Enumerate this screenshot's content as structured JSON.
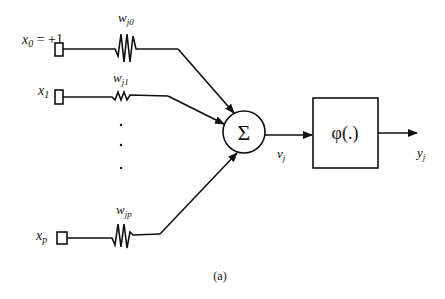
{
  "diagram": {
    "type": "neuron-model",
    "caption": "(a)",
    "inputs": [
      {
        "id": "x0",
        "label": "x",
        "sub": "0",
        "suffix": " = +1",
        "weight_label": "w",
        "weight_sub": "j0"
      },
      {
        "id": "x1",
        "label": "x",
        "sub": "1",
        "suffix": "",
        "weight_label": "w",
        "weight_sub": "j1"
      },
      {
        "id": "xp",
        "label": "x",
        "sub": "p",
        "suffix": "",
        "weight_label": "w",
        "weight_sub": "jp"
      }
    ],
    "ellipsis": "· · ·",
    "summing_junction": {
      "symbol": "Σ"
    },
    "induced_field": {
      "label": "v",
      "sub": "j"
    },
    "activation": {
      "label": "φ(.)"
    },
    "output": {
      "label": "y",
      "sub": "j"
    }
  }
}
